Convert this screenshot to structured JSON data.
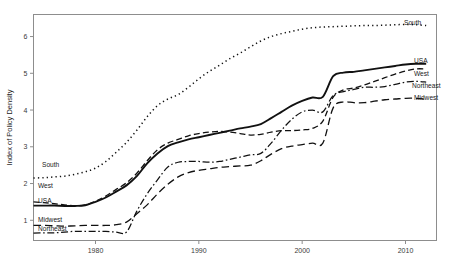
{
  "chart_data": {
    "type": "line",
    "title": "",
    "subtitle": "",
    "xlabel": "",
    "ylabel": "Index of Policy Density",
    "xlim": [
      1974,
      2013
    ],
    "ylim": [
      0.45,
      6.6
    ],
    "xticks": [
      1980,
      1990,
      2000,
      2010
    ],
    "xtick_labels": [
      "1980",
      "1990",
      "2000",
      "2010"
    ],
    "yticks": [
      1,
      2,
      3,
      4,
      5,
      6
    ],
    "ytick_labels": [
      "1",
      "2",
      "3",
      "4",
      "5",
      "6"
    ],
    "grid": false,
    "legend_position": "inline-endpoints",
    "x": [
      1974,
      1975,
      1976,
      1977,
      1978,
      1979,
      1980,
      1981,
      1982,
      1983,
      1984,
      1985,
      1986,
      1987,
      1988,
      1989,
      1990,
      1991,
      1992,
      1993,
      1994,
      1995,
      1996,
      1997,
      1998,
      1999,
      2000,
      2001,
      2002,
      2003,
      2004,
      2005,
      2006,
      2007,
      2008,
      2009,
      2010,
      2011,
      2012
    ],
    "series": [
      {
        "name": "South",
        "style": "dotted",
        "label_left": "South",
        "label_right": "South",
        "values": [
          2.15,
          2.16,
          2.18,
          2.2,
          2.25,
          2.32,
          2.42,
          2.6,
          2.85,
          3.12,
          3.45,
          3.82,
          4.12,
          4.3,
          4.42,
          4.62,
          4.85,
          5.05,
          5.22,
          5.4,
          5.55,
          5.72,
          5.88,
          6.0,
          6.08,
          6.14,
          6.2,
          6.24,
          6.26,
          6.27,
          6.28,
          6.29,
          6.3,
          6.3,
          6.31,
          6.32,
          6.33,
          6.32,
          6.3
        ]
      },
      {
        "name": "USA",
        "style": "solid-thick",
        "label_left": "USA",
        "label_right": "USA",
        "values": [
          1.4,
          1.4,
          1.4,
          1.39,
          1.39,
          1.41,
          1.5,
          1.62,
          1.78,
          1.95,
          2.2,
          2.55,
          2.82,
          3.02,
          3.12,
          3.2,
          3.26,
          3.32,
          3.38,
          3.44,
          3.5,
          3.55,
          3.62,
          3.78,
          3.95,
          4.12,
          4.25,
          4.34,
          4.36,
          4.92,
          5.02,
          5.04,
          5.08,
          5.12,
          5.16,
          5.2,
          5.24,
          5.26,
          5.26
        ]
      },
      {
        "name": "West",
        "style": "dashed",
        "label_left": "West",
        "label_right": "West",
        "values": [
          1.5,
          1.48,
          1.45,
          1.42,
          1.4,
          1.42,
          1.52,
          1.66,
          1.84,
          2.02,
          2.28,
          2.62,
          2.92,
          3.1,
          3.2,
          3.3,
          3.36,
          3.4,
          3.42,
          3.4,
          3.36,
          3.32,
          3.34,
          3.4,
          3.44,
          3.44,
          3.46,
          3.5,
          3.7,
          4.35,
          4.55,
          4.6,
          4.68,
          4.78,
          4.88,
          4.98,
          5.06,
          5.12,
          5.12
        ]
      },
      {
        "name": "Northeast",
        "style": "dash-dot",
        "label_left": "Northeast",
        "label_right": "Northeast",
        "values": [
          0.65,
          0.66,
          0.66,
          0.68,
          0.7,
          0.7,
          0.7,
          0.7,
          0.68,
          0.68,
          1.25,
          1.72,
          2.1,
          2.45,
          2.58,
          2.6,
          2.6,
          2.58,
          2.6,
          2.66,
          2.72,
          2.78,
          2.82,
          3.1,
          3.45,
          3.75,
          3.95,
          4.0,
          3.95,
          4.4,
          4.5,
          4.56,
          4.62,
          4.62,
          4.64,
          4.7,
          4.76,
          4.78,
          4.76
        ]
      },
      {
        "name": "Midwest",
        "style": "dashed-long",
        "label_left": "Midwest",
        "label_right": "Midwest",
        "values": [
          0.86,
          0.86,
          0.85,
          0.84,
          0.85,
          0.86,
          0.86,
          0.86,
          0.88,
          0.95,
          1.18,
          1.42,
          1.72,
          1.98,
          2.18,
          2.3,
          2.36,
          2.4,
          2.44,
          2.46,
          2.48,
          2.5,
          2.62,
          2.8,
          2.95,
          3.02,
          3.06,
          3.1,
          3.1,
          4.06,
          4.22,
          4.2,
          4.2,
          4.24,
          4.28,
          4.3,
          4.32,
          4.32,
          4.3
        ]
      }
    ]
  },
  "axis": {
    "y_title": "Index of Policy Density"
  }
}
